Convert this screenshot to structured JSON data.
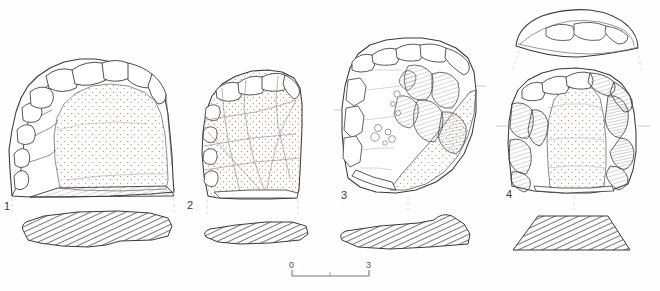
{
  "plate": {
    "background_color": "#fefefe",
    "ink_color": "#3a3a3a",
    "stipple_color": "#9a8f86",
    "hatch_color": "#555555",
    "width": 660,
    "height": 291
  },
  "artefacts": [
    {
      "number": "1",
      "label_x": 4,
      "label_y": 201,
      "description": "flake with cortical dorsal surface, stippled interior, retouched upper margin",
      "has_section": true,
      "section_style": "hatched"
    },
    {
      "number": "2",
      "label_x": 187,
      "label_y": 200,
      "description": "flake with stippled surface and multiple flake-scar ridges",
      "has_section": true,
      "section_style": "hatched"
    },
    {
      "number": "3",
      "label_x": 341,
      "label_y": 190,
      "description": "core fragment with fossil inclusions and shaded flake scars",
      "has_section": true,
      "section_style": "hatched"
    },
    {
      "number": "4",
      "label_x": 506,
      "label_y": 189,
      "description": "flake with separate top profile view above, stippled body, shaded lateral retouch",
      "has_section": true,
      "section_style": "hatched",
      "has_top_profile": true
    }
  ],
  "scale_bar": {
    "start_label": "0",
    "end_label": "3",
    "unit": "cm",
    "x_start": 292,
    "x_end": 369,
    "y": 276,
    "tick_mid": true
  }
}
